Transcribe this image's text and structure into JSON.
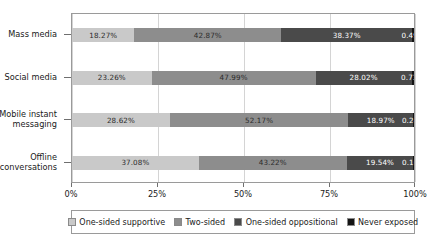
{
  "chart_data": {
    "type": "bar",
    "orientation": "horizontal",
    "stacked": true,
    "normalized_percent": true,
    "title": "",
    "subtitle": "",
    "xlabel": "",
    "ylabel": "",
    "xlim": [
      0,
      100
    ],
    "xticks": [
      0,
      25,
      50,
      75,
      100
    ],
    "xtick_labels": [
      "0%",
      "25%",
      "50%",
      "75%",
      "100%"
    ],
    "grid": "vertical",
    "legend_position": "bottom",
    "categories": [
      "Mass media",
      "Social media",
      "Mobile instant messaging",
      "Offline conversations"
    ],
    "series": [
      {
        "name": "One-sided supportive",
        "color": "#c9c9c9",
        "values": [
          18.27,
          23.26,
          28.62,
          37.08
        ],
        "labels": [
          "18.27%",
          "23.26%",
          "28.62%",
          "37.08%"
        ]
      },
      {
        "name": "Two-sided",
        "color": "#8d8d8d",
        "values": [
          42.87,
          47.99,
          52.17,
          43.22
        ],
        "labels": [
          "42.87%",
          "47.99%",
          "52.17%",
          "43.22%"
        ]
      },
      {
        "name": "One-sided oppositional",
        "color": "#4a4a4a",
        "values": [
          38.37,
          28.02,
          18.97,
          19.54
        ],
        "labels": [
          "38.37%",
          "28.02%",
          "18.97%",
          "19.54%"
        ]
      },
      {
        "name": "Never exposed",
        "color": "#141414",
        "values": [
          0.49,
          0.73,
          0.24,
          0.16
        ],
        "labels": [
          "0.49%",
          "0.73%",
          "0.24%",
          "0.16%"
        ]
      }
    ]
  },
  "legend": {
    "items": [
      {
        "label": "One-sided supportive"
      },
      {
        "label": "Two-sided"
      },
      {
        "label": "One-sided oppositional"
      },
      {
        "label": "Never exposed"
      }
    ]
  }
}
